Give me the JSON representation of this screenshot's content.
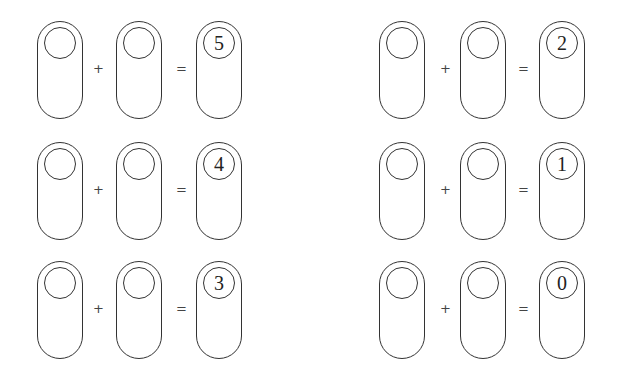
{
  "worksheet": {
    "operators": {
      "plus": "+",
      "equals": "="
    },
    "equations": [
      {
        "addend1": "",
        "addend2": "",
        "sum": "5"
      },
      {
        "addend1": "",
        "addend2": "",
        "sum": "4"
      },
      {
        "addend1": "",
        "addend2": "",
        "sum": "3"
      },
      {
        "addend1": "",
        "addend2": "",
        "sum": "2"
      },
      {
        "addend1": "",
        "addend2": "",
        "sum": "1"
      },
      {
        "addend1": "",
        "addend2": "",
        "sum": "0"
      }
    ]
  }
}
